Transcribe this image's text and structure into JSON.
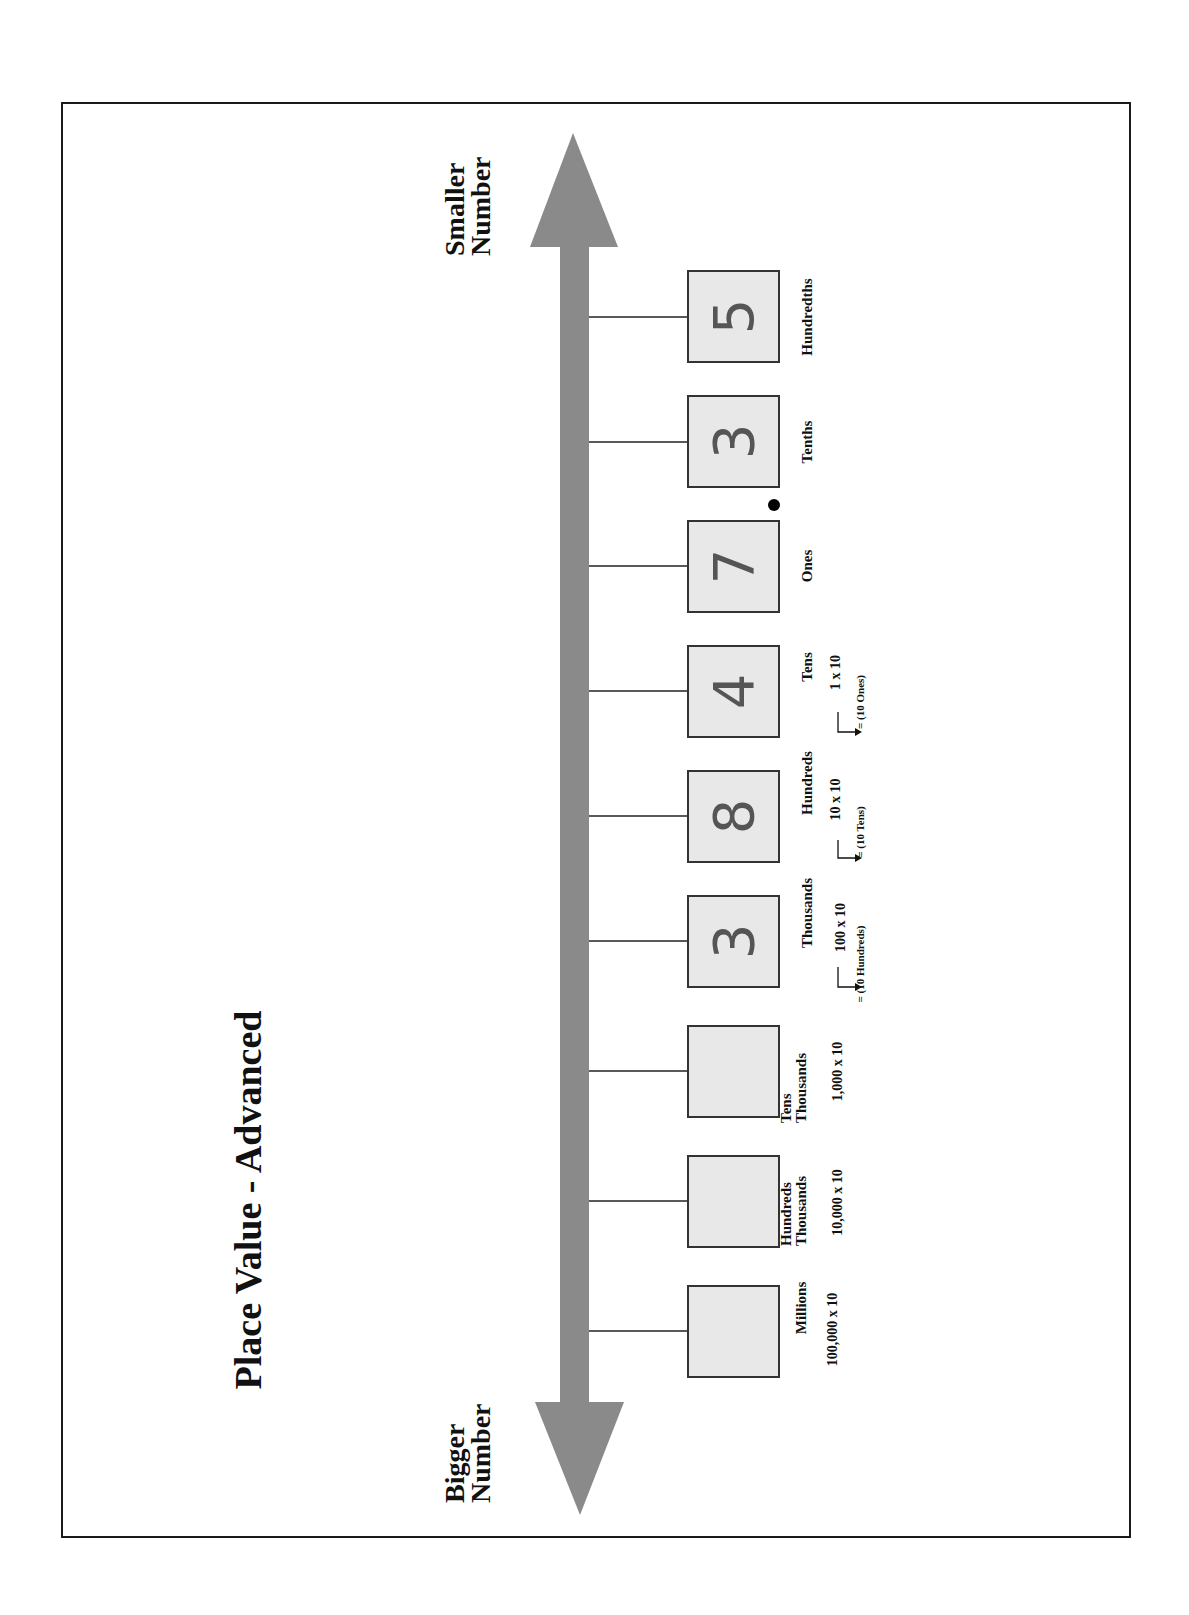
{
  "title": "Place Value - Advanced",
  "arrow": {
    "top_label_line1": "Smaller",
    "top_label_line2": "Number",
    "bottom_label_line1": "Bigger",
    "bottom_label_line2": "Number",
    "color": "#8a8a8a"
  },
  "box_fill": "#e8e8e8",
  "places": [
    {
      "name": "Hundredths",
      "digit": "5",
      "multiplier": "",
      "equals": ""
    },
    {
      "name": "Tenths",
      "digit": "3",
      "multiplier": "",
      "equals": ""
    },
    {
      "name": "Ones",
      "digit": "7",
      "multiplier": "",
      "equals": ""
    },
    {
      "name": "Tens",
      "digit": "4",
      "multiplier": "1 x 10",
      "equals": "= (10 Ones)"
    },
    {
      "name": "Hundreds",
      "digit": "8",
      "multiplier": "10 x 10",
      "equals": "= (10 Tens)"
    },
    {
      "name": "Thousands",
      "digit": "3",
      "multiplier": "100 x 10",
      "equals": "= (10 Hundreds)"
    },
    {
      "name_line1": "Tens",
      "name_line2": "Thousands",
      "digit": "",
      "multiplier": "1,000 x 10",
      "equals": ""
    },
    {
      "name_line1": "Hundreds",
      "name_line2": "Thousands",
      "digit": "",
      "multiplier": "10,000 x 10",
      "equals": ""
    },
    {
      "name": "Millions",
      "digit": "",
      "multiplier": "100,000 x 10",
      "equals": ""
    }
  ],
  "decimal_point": "•"
}
